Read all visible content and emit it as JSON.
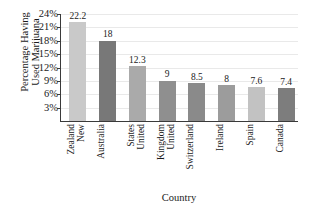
{
  "chart_data": {
    "type": "bar",
    "title": "",
    "xlabel": "Country",
    "ylabel": "Percentage Having Used Marijuana",
    "ylabel_lines": [
      "Percentage Having",
      "Used Marijuana"
    ],
    "categories": [
      "New Zealand",
      "Australia",
      "United States",
      "United Kingdom",
      "Switzerland",
      "Ireland",
      "Spain",
      "Canada"
    ],
    "category_lines": [
      [
        "New",
        "Zealand"
      ],
      [
        "Australia"
      ],
      [
        "United",
        "States"
      ],
      [
        "United",
        "Kingdom"
      ],
      [
        "Switzerland"
      ],
      [
        "Ireland"
      ],
      [
        "Spain"
      ],
      [
        "Canada"
      ]
    ],
    "values": [
      22.2,
      18,
      12.3,
      9,
      8.5,
      8,
      7.6,
      7.4
    ],
    "value_labels": [
      "22.2",
      "18",
      "12.3",
      "9",
      "8.5",
      "8",
      "7.6",
      "7.4"
    ],
    "bar_colors": [
      "#c9c9c9",
      "#787878",
      "#aaaaaa",
      "#8f8f8f",
      "#8a8a8a",
      "#9c9c9c",
      "#c2c2c2",
      "#7d7d7d"
    ],
    "ylim": [
      0,
      24
    ],
    "ytick_values": [
      24,
      21,
      18,
      15,
      12,
      9,
      6,
      3
    ],
    "ytick_labels": [
      "24%",
      "21%",
      "18%",
      "15%",
      "12%",
      "9%",
      "6%",
      "3%"
    ],
    "grid": true,
    "legend": false,
    "axis_color": "#3a3a3a",
    "gridline_color": "#e9e9e9",
    "background": "#ffffff"
  }
}
